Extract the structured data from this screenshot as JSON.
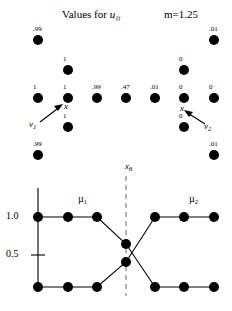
{
  "figure": {
    "title": "Values for",
    "title_symbol": "u",
    "title_symbol_sub": "1j",
    "fuzzifier": "m=1.25"
  },
  "chart_data": [
    {
      "type": "scatter",
      "title": "Values for u1j   m=1.25",
      "xlabel": "",
      "ylabel": "",
      "description": "Two-dimensional cross-shaped data set with fuzzy c-means membership value u1j printed above each point",
      "point_label_key": "u1j",
      "points": [
        {
          "x": 1,
          "y": 5,
          "label": ".99",
          "px": 38,
          "py": 40
        },
        {
          "x": 7,
          "y": 5,
          "label": ".01",
          "px": 214,
          "py": 40
        },
        {
          "x": 2,
          "y": 4,
          "label": "1",
          "px": 68,
          "py": 70
        },
        {
          "x": 6,
          "y": 4,
          "label": "0",
          "px": 184,
          "py": 70
        },
        {
          "x": 1,
          "y": 3,
          "label": "1",
          "px": 38,
          "py": 98
        },
        {
          "x": 2,
          "y": 3,
          "label": "1",
          "px": 68,
          "py": 98
        },
        {
          "x": 3,
          "y": 3,
          "label": ".99",
          "px": 97,
          "py": 98
        },
        {
          "x": 4,
          "y": 3,
          "label": ".47",
          "px": 126,
          "py": 98
        },
        {
          "x": 5,
          "y": 3,
          "label": ".01",
          "px": 155,
          "py": 98
        },
        {
          "x": 6,
          "y": 3,
          "label": "0",
          "px": 184,
          "py": 98
        },
        {
          "x": 7,
          "y": 3,
          "label": "0",
          "px": 214,
          "py": 98
        },
        {
          "x": 2,
          "y": 2,
          "label": "1",
          "px": 68,
          "py": 127
        },
        {
          "x": 6,
          "y": 2,
          "label": "0",
          "px": 184,
          "py": 127
        },
        {
          "x": 1,
          "y": 1,
          "label": ".99",
          "px": 38,
          "py": 155
        },
        {
          "x": 7,
          "y": 1,
          "label": ".01",
          "px": 214,
          "py": 155
        }
      ],
      "annotations": [
        {
          "name": "prototype-1",
          "text": "x",
          "sub": "",
          "px": 66,
          "py": 106
        },
        {
          "name": "prototype-1-vector",
          "text": "v",
          "sub": "1",
          "px": 32,
          "py": 124
        },
        {
          "name": "prototype-2",
          "text": "x",
          "sub": "",
          "px": 182,
          "py": 108
        },
        {
          "name": "prototype-2-vector",
          "text": "v",
          "sub": "2",
          "px": 206,
          "py": 126
        },
        {
          "name": "x8-marker",
          "text": "x",
          "sub": "8",
          "px": 127,
          "py": 166
        }
      ]
    },
    {
      "type": "line",
      "title": "",
      "xlabel": "",
      "ylabel": "",
      "ylim": [
        0,
        1.15
      ],
      "yticks": [
        0.5,
        1.0
      ],
      "ytick_labels": [
        "0.5",
        "1.0"
      ],
      "grid": false,
      "legend": "inline",
      "vline_at": "x8",
      "x": [
        1,
        2,
        3,
        4,
        4,
        5,
        6,
        7
      ],
      "series": [
        {
          "name": "µ",
          "name_sub": "1",
          "label": "µ1",
          "values": [
            1.0,
            1.0,
            1.0,
            0.63,
            0.0,
            0.0,
            0.0,
            0.0
          ],
          "points_px": [
            {
              "px": 38,
              "py": 217
            },
            {
              "px": 68,
              "py": 217
            },
            {
              "px": 97,
              "py": 217
            },
            {
              "px": 126,
              "py": 244
            },
            {
              "px": 155,
              "py": 287
            },
            {
              "px": 184,
              "py": 287
            },
            {
              "px": 214,
              "py": 287
            }
          ]
        },
        {
          "name": "µ",
          "name_sub": "2",
          "label": "µ2",
          "values": [
            0.0,
            0.0,
            0.0,
            0.41,
            1.0,
            1.0,
            1.0,
            1.0
          ],
          "points_px": [
            {
              "px": 38,
              "py": 287
            },
            {
              "px": 68,
              "py": 287
            },
            {
              "px": 97,
              "py": 287
            },
            {
              "px": 126,
              "py": 262
            },
            {
              "px": 155,
              "py": 217
            },
            {
              "px": 184,
              "py": 217
            },
            {
              "px": 214,
              "py": 217
            }
          ]
        }
      ],
      "annotations": [
        {
          "name": "mu1-label",
          "text": "µ",
          "sub": "1",
          "px": 79,
          "py": 198
        },
        {
          "name": "mu2-label",
          "text": "µ",
          "sub": "2",
          "px": 190,
          "py": 198
        }
      ]
    }
  ]
}
